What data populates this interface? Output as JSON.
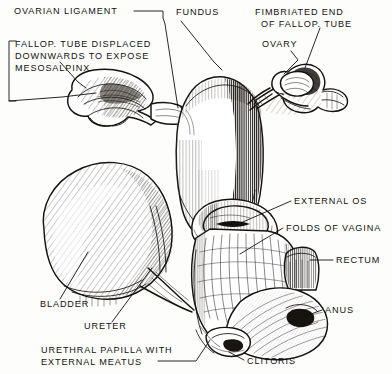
{
  "figure": {
    "style": "pen-and-ink engraving",
    "background_color": "#fdfdfb",
    "ink_color": "#16130f"
  },
  "labels": [
    {
      "id": "ovarian-ligament",
      "text": "OVARIAN LIGAMENT",
      "lines": [
        "OVARIAN LIGAMENT"
      ],
      "x": 14,
      "y": 14,
      "anchor": "start"
    },
    {
      "id": "fundus",
      "text": "FUNDUS",
      "lines": [
        "FUNDUS"
      ],
      "x": 176,
      "y": 15,
      "anchor": "start"
    },
    {
      "id": "fimbriated-end",
      "text": "FIMBRIATED END OF FALLOP. TUBE",
      "lines": [
        "FIMBRIATED END",
        "OF FALLOP. TUBE"
      ],
      "x": 255,
      "y": 15,
      "anchor": "start"
    },
    {
      "id": "ovary",
      "text": "OVARY",
      "lines": [
        "OVARY"
      ],
      "x": 262,
      "y": 47,
      "anchor": "start"
    },
    {
      "id": "fallop-displaced",
      "text": "FALLOP. TUBE DISPLACED DOWNWARDS TO EXPOSE MESOSALPINX",
      "lines": [
        "FALLOP. TUBE DISPLACED",
        "DOWNWARDS TO EXPOSE",
        "MESOSALPINX"
      ],
      "x": 13,
      "y": 47,
      "anchor": "start"
    },
    {
      "id": "external-os",
      "text": "EXTERNAL OS",
      "lines": [
        "EXTERNAL OS"
      ],
      "x": 294,
      "y": 204,
      "anchor": "start"
    },
    {
      "id": "folds-of-vagina",
      "text": "FOLDS OF VAGINA",
      "lines": [
        "FOLDS OF VAGINA"
      ],
      "x": 286,
      "y": 231,
      "anchor": "start"
    },
    {
      "id": "rectum",
      "text": "RECTUM",
      "lines": [
        "RECTUM"
      ],
      "x": 336,
      "y": 263,
      "anchor": "start"
    },
    {
      "id": "anus",
      "text": "ANUS",
      "lines": [
        "ANUS"
      ],
      "x": 325,
      "y": 313,
      "anchor": "start"
    },
    {
      "id": "bladder",
      "text": "BLADDER",
      "lines": [
        "BLADDER"
      ],
      "x": 40,
      "y": 307,
      "anchor": "start"
    },
    {
      "id": "ureter",
      "text": "URETER",
      "lines": [
        "URETER"
      ],
      "x": 84,
      "y": 329,
      "anchor": "start"
    },
    {
      "id": "urethral-papilla",
      "text": "URETHRAL PAPILLA WITH EXTERNAL MEATUS",
      "lines": [
        "URETHRAL PAPILLA WITH",
        "EXTERNAL MEATUS"
      ],
      "x": 41,
      "y": 353,
      "anchor": "start"
    },
    {
      "id": "clitoris",
      "text": "CLITORIS",
      "lines": [
        "CLITORIS"
      ],
      "x": 247,
      "y": 364,
      "anchor": "start"
    }
  ],
  "structures": [
    {
      "id": "uterus-body",
      "name": "uterus body and fundus"
    },
    {
      "id": "uterine-tube-left",
      "name": "displaced fallopian tube with mesosalpinx"
    },
    {
      "id": "uterine-tube-right",
      "name": "fallopian tube with fimbriated end"
    },
    {
      "id": "ovary-right",
      "name": "ovary"
    },
    {
      "id": "bladder-organ",
      "name": "urinary bladder"
    },
    {
      "id": "ureter-duct",
      "name": "ureter"
    },
    {
      "id": "cervix-os",
      "name": "cervix and external os"
    },
    {
      "id": "vagina-folds",
      "name": "vaginal rugae"
    },
    {
      "id": "rectum-organ",
      "name": "rectum"
    },
    {
      "id": "perineum",
      "name": "perineum, anus and clitoris"
    }
  ]
}
